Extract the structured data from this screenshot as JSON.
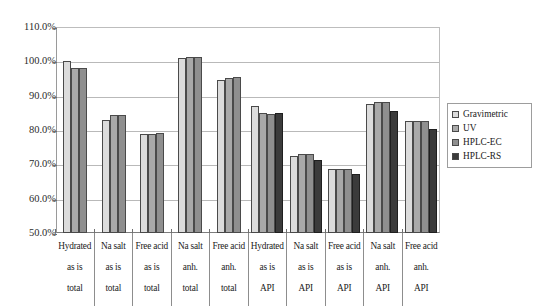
{
  "chart_data": {
    "type": "bar",
    "title": "",
    "xlabel": "",
    "ylabel": "",
    "ylim": [
      50,
      110
    ],
    "ytick_labels": [
      "110.0%",
      "100.0%",
      "90.0%",
      "80.0%",
      "70.0%",
      "60.0%",
      "50.0%"
    ],
    "ytick_values": [
      110,
      100,
      90,
      80,
      70,
      60,
      50
    ],
    "grid": true,
    "legend_position": "right",
    "categories": [
      "Hydrated as is total",
      "Na salt as is total",
      "Free acid as is total",
      "Na salt anh. total",
      "Free acid anh. total",
      "Hydrated as is API",
      "Na salt as is API",
      "Free acid as is API",
      "Na salt anh. API",
      "Free acid anh. API"
    ],
    "category_lines": [
      [
        "Hydrated",
        "as is",
        "total"
      ],
      [
        "Na salt",
        "as is",
        "total"
      ],
      [
        "Free acid",
        "as is",
        "total"
      ],
      [
        "Na salt",
        "anh.",
        "total"
      ],
      [
        "Free acid",
        "anh.",
        "total"
      ],
      [
        "Hydrated",
        "as is",
        "API"
      ],
      [
        "Na salt",
        "as is",
        "API"
      ],
      [
        "Free acid",
        "as is",
        "API"
      ],
      [
        "Na salt",
        "anh.",
        "API"
      ],
      [
        "Free acid",
        "anh.",
        "API"
      ]
    ],
    "series": [
      {
        "name": "Gravimetric",
        "color": "#dcdcdc",
        "values": [
          100.0,
          83.0,
          78.8,
          101.0,
          94.7,
          87.0,
          72.5,
          68.5,
          87.6,
          82.5
        ]
      },
      {
        "name": "UV",
        "color": "#a9a9a9",
        "values": [
          98.0,
          84.4,
          78.8,
          101.3,
          95.2,
          85.0,
          73.0,
          68.6,
          88.1,
          82.6
        ]
      },
      {
        "name": "HPLC-EC",
        "color": "#8f8f8f",
        "values": [
          98.0,
          84.5,
          79.0,
          101.3,
          95.4,
          84.8,
          73.0,
          68.5,
          88.1,
          82.6
        ]
      },
      {
        "name": "HPLC-RS",
        "color": "#3b3b3b",
        "values": [
          null,
          null,
          null,
          null,
          null,
          85.0,
          71.2,
          67.2,
          85.6,
          80.2
        ]
      }
    ]
  },
  "legend": {
    "items": [
      {
        "label": "Gravimetric",
        "color": "#dcdcdc"
      },
      {
        "label": "UV",
        "color": "#a9a9a9"
      },
      {
        "label": "HPLC-EC",
        "color": "#8f8f8f"
      },
      {
        "label": "HPLC-RS",
        "color": "#3b3b3b"
      }
    ]
  }
}
